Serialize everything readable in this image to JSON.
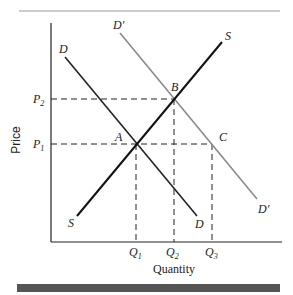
{
  "diagram": {
    "type": "supply-demand",
    "axes": {
      "xlabel": "Quantity",
      "ylabel": "Price"
    },
    "curves": [
      {
        "name": "supply",
        "label_start": "S",
        "label_end": "S",
        "color": "#111111"
      },
      {
        "name": "demand",
        "label_start": "D",
        "label_end": "D",
        "color": "#222222"
      },
      {
        "name": "demand-shifted",
        "label_start": "D'",
        "label_end": "D'",
        "color": "#8a8a8a"
      }
    ],
    "points": [
      {
        "label": "A"
      },
      {
        "label": "B"
      },
      {
        "label": "C"
      }
    ],
    "price_ticks": [
      {
        "base": "P",
        "sub": "2"
      },
      {
        "base": "P",
        "sub": "1"
      }
    ],
    "quantity_ticks": [
      {
        "base": "Q",
        "sub": "1"
      },
      {
        "base": "Q",
        "sub": "2"
      },
      {
        "base": "Q",
        "sub": "3"
      }
    ],
    "colors": {
      "rule": "#999999",
      "bottom_bar": "#555555"
    }
  }
}
